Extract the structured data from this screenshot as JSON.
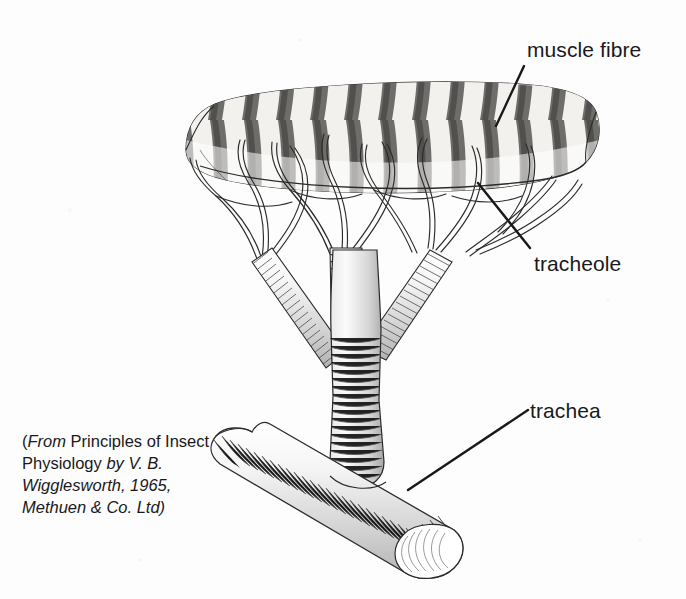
{
  "figure": {
    "background_color": "#fdfdfd",
    "ink_color": "#19191b",
    "labels": [
      {
        "id": "muscle-fibre",
        "text": "muscle fibre"
      },
      {
        "id": "tracheole",
        "text": "tracheole"
      },
      {
        "id": "trachea",
        "text": "trachea"
      }
    ],
    "attribution": {
      "open_paren": "(",
      "from": "From ",
      "work_title": "Principles of Insect Physiology",
      "by": " by ",
      "author": "V. B. Wigglesworth",
      "rest": ", 1965, Methuen & Co. Ltd)",
      "full_text": "(From Principles of Insect Physiology by V. B. Wigglesworth, 1965, Methuen & Co. Ltd)"
    },
    "parts": [
      {
        "name": "muscle-fibre",
        "description": "striated banded cylinder across the top"
      },
      {
        "name": "tracheole-network",
        "description": "fine branching tubes fanning onto the fibre"
      },
      {
        "name": "tracheal-trunk",
        "description": "ribbed vertical stem"
      },
      {
        "name": "trachea",
        "description": "large ribbed horizontal tube at the base"
      }
    ]
  }
}
